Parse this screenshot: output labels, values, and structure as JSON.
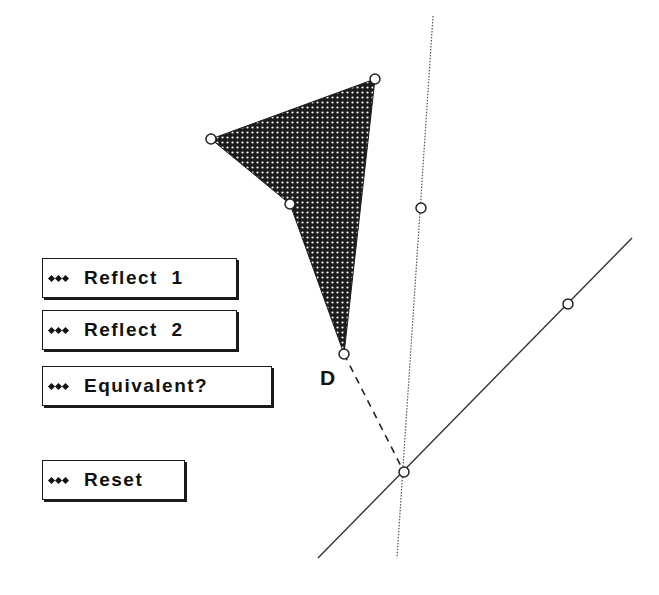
{
  "buttons": [
    {
      "id": "reflect-1",
      "label": "Reflect  1",
      "x": 42,
      "y": 258,
      "w": 195,
      "h": 40
    },
    {
      "id": "reflect-2",
      "label": "Reflect  2",
      "x": 42,
      "y": 310,
      "w": 195,
      "h": 40
    },
    {
      "id": "equivalent",
      "label": "Equivalent?",
      "x": 42,
      "y": 366,
      "w": 230,
      "h": 40
    },
    {
      "id": "reset",
      "label": "Reset",
      "x": 42,
      "y": 460,
      "w": 143,
      "h": 40
    }
  ],
  "icons": {
    "button_action": "diamond-dots-icon"
  },
  "diagram": {
    "point_label": "D",
    "polygon": {
      "fill": "#222222",
      "vertices": [
        [
          375,
          79
        ],
        [
          211,
          139
        ],
        [
          290,
          204
        ],
        [
          344,
          354
        ]
      ]
    },
    "points": [
      {
        "name": "polygon-vertex-top",
        "x": 375,
        "y": 79
      },
      {
        "name": "polygon-vertex-left",
        "x": 211,
        "y": 139
      },
      {
        "name": "polygon-vertex-inner",
        "x": 290,
        "y": 204
      },
      {
        "name": "point-d",
        "x": 344,
        "y": 354
      },
      {
        "name": "mirror-line-1-handle",
        "x": 421,
        "y": 208
      },
      {
        "name": "mirror-line-2-handle",
        "x": 568,
        "y": 304
      },
      {
        "name": "intersection-point",
        "x": 404,
        "y": 472
      }
    ],
    "dotted_line": {
      "x1": 433,
      "y1": 16,
      "x2": 397,
      "y2": 558
    },
    "solid_line": {
      "x1": 318,
      "y1": 558,
      "x2": 632,
      "y2": 238
    },
    "dashed_segment": {
      "x1": 344,
      "y1": 354,
      "x2": 404,
      "y2": 472
    }
  }
}
